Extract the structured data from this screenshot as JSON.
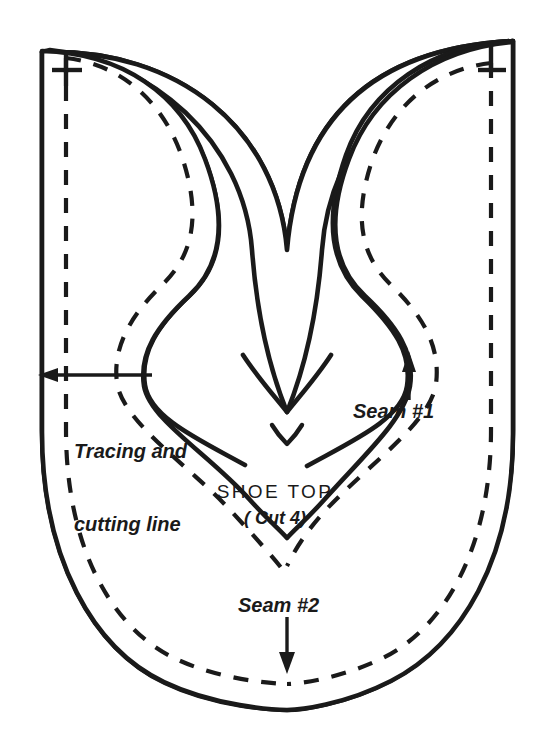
{
  "document": {
    "kind": "sewing-pattern-diagram",
    "title": "SHOE TOP",
    "background_color": "#ffffff",
    "ink_color": "#1a1a1a"
  },
  "pattern": {
    "piece_name": "SHOE TOP",
    "cut_instruction": "( Cut 4)",
    "outline": {
      "name": "cutting-line",
      "style": "solid",
      "color": "#1a1a1a",
      "stroke_width": 4
    },
    "stitch_line": {
      "name": "seam-line",
      "style": "dashed",
      "color": "#1a1a1a",
      "stroke_width": 4,
      "dash_pattern": "14 13"
    },
    "registration_marks": [
      {
        "name": "cross-mark-top-left",
        "glyph": "+"
      },
      {
        "name": "tee-mark-top-right",
        "glyph": "T"
      }
    ]
  },
  "annotations": [
    {
      "id": "tracing",
      "text_line_1": "Tracing and",
      "text_line_2": "cutting line",
      "arrow_direction": "left",
      "points_to": "cutting-line"
    },
    {
      "id": "seam1",
      "text": "Seam #1",
      "arrow_direction": "up",
      "points_to": "seam-line"
    },
    {
      "id": "seam2",
      "text": "Seam #2",
      "arrow_direction": "down",
      "points_to": "seam-line"
    }
  ],
  "labels": {
    "tracing_line_1": "Tracing and",
    "tracing_line_2": "cutting line",
    "seam_1": "Seam #1",
    "seam_2": "Seam #2",
    "shoe_top": "SHOE TOP",
    "cut_count": "( Cut 4)"
  }
}
